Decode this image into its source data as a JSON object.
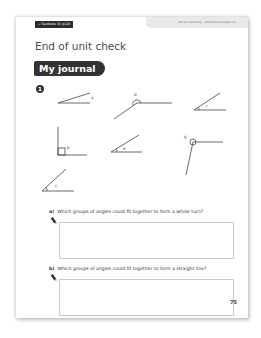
{
  "header": {
    "textbook_ref": "→ Textbook 3C p120",
    "unit_label": "Unit 13: Geometry – properties of shapes (1)"
  },
  "title": "End of unit check",
  "section": "My journal",
  "question_number": "1",
  "angles": [
    {
      "label": "a",
      "type": "acute"
    },
    {
      "label": "d",
      "type": "obtuse"
    },
    {
      "label": "f",
      "type": "acute"
    },
    {
      "label": "b",
      "type": "right"
    },
    {
      "label": "e",
      "type": "acute"
    },
    {
      "label": "g",
      "type": "obtuse"
    },
    {
      "label": "c",
      "type": "acute"
    }
  ],
  "questions": [
    {
      "letter": "a)",
      "text": "Which groups of angles could fit together to form a whole turn?",
      "answer": ""
    },
    {
      "letter": "b)",
      "text": "Which groups of angles could fit together to form a straight line?",
      "answer": ""
    }
  ],
  "page_number": "75",
  "colors": {
    "dark": "#333333",
    "header_band": "#e9e9e9",
    "box_border": "#c8c8c8"
  }
}
